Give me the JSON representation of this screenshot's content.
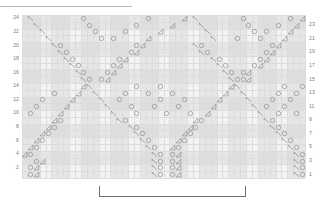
{
  "chart_meta": {
    "title": "",
    "type": "knitting-lace-chart",
    "columns": 48,
    "rows": 24,
    "grid_left_px": 22,
    "grid_top_px": 15,
    "grid_width_px": 283,
    "grid_height_px": 163,
    "cell_w_px": 5.896,
    "cell_h_px": 6.792,
    "colors": {
      "grid_background": "#f3f3f3",
      "grid_line": "#dcdcdc",
      "shaded_band": "#e6e6e6",
      "symbol_stroke": "#8c8c8c",
      "row_label": "#7d7d7d",
      "bracket": "#6f6f6f",
      "top_rule": "#b9b9b9"
    }
  },
  "row_labels_left": [
    "24",
    "22",
    "20",
    "18",
    "16",
    "14",
    "12",
    "10",
    "8",
    "6",
    "4",
    "2"
  ],
  "row_labels_right": [
    "23",
    "21",
    "19",
    "17",
    "15",
    "13",
    "11",
    "9",
    "7",
    "5",
    "3",
    "1"
  ],
  "legend": {
    "yarn_over": "O",
    "ssk_left_leaning_decrease": "left-triangle",
    "k2tog_right_leaning_decrease": "right-triangle"
  },
  "repeat_bracket": {
    "label": "",
    "start_col": 13,
    "end_col": 37
  },
  "shaded_column_bands": [
    {
      "start_col": 0,
      "end_col": 2
    },
    {
      "start_col": 5,
      "end_col": 7
    },
    {
      "start_col": 10,
      "end_col": 12
    },
    {
      "start_col": 15,
      "end_col": 17
    },
    {
      "start_col": 20,
      "end_col": 22
    },
    {
      "start_col": 25,
      "end_col": 27
    },
    {
      "start_col": 30,
      "end_col": 32
    },
    {
      "start_col": 35,
      "end_col": 37
    },
    {
      "start_col": 40,
      "end_col": 42
    },
    {
      "start_col": 45,
      "end_col": 47
    }
  ],
  "chart_data": {
    "type": "heatmap",
    "xlabel": "stitch",
    "ylabel": "row",
    "symbols": [
      {
        "row": 24,
        "col": 1,
        "s": "ssk"
      },
      {
        "row": 24,
        "col": 10,
        "s": "yo"
      },
      {
        "row": 24,
        "col": 21,
        "s": "yo"
      },
      {
        "row": 24,
        "col": 27,
        "s": "k2tog"
      },
      {
        "row": 24,
        "col": 29,
        "s": "ssk"
      },
      {
        "row": 24,
        "col": 37,
        "s": "yo"
      },
      {
        "row": 24,
        "col": 45,
        "s": "yo"
      },
      {
        "row": 24,
        "col": 47,
        "s": "k2tog"
      },
      {
        "row": 23,
        "col": 2,
        "s": "ssk"
      },
      {
        "row": 23,
        "col": 11,
        "s": "yo"
      },
      {
        "row": 23,
        "col": 19,
        "s": "yo"
      },
      {
        "row": 23,
        "col": 25,
        "s": "k2tog"
      },
      {
        "row": 23,
        "col": 30,
        "s": "ssk"
      },
      {
        "row": 23,
        "col": 38,
        "s": "yo"
      },
      {
        "row": 23,
        "col": 43,
        "s": "yo"
      },
      {
        "row": 23,
        "col": 46,
        "s": "k2tog"
      },
      {
        "row": 22,
        "col": 3,
        "s": "ssk"
      },
      {
        "row": 22,
        "col": 12,
        "s": "yo"
      },
      {
        "row": 22,
        "col": 17,
        "s": "yo"
      },
      {
        "row": 22,
        "col": 23,
        "s": "k2tog"
      },
      {
        "row": 22,
        "col": 31,
        "s": "ssk"
      },
      {
        "row": 22,
        "col": 39,
        "s": "yo"
      },
      {
        "row": 22,
        "col": 41,
        "s": "yo"
      },
      {
        "row": 22,
        "col": 45,
        "s": "k2tog"
      },
      {
        "row": 21,
        "col": 4,
        "s": "ssk"
      },
      {
        "row": 21,
        "col": 13,
        "s": "yo"
      },
      {
        "row": 21,
        "col": 15,
        "s": "yo"
      },
      {
        "row": 21,
        "col": 21,
        "s": "k2tog"
      },
      {
        "row": 21,
        "col": 32,
        "s": "ssk"
      },
      {
        "row": 21,
        "col": 36,
        "s": "yo"
      },
      {
        "row": 21,
        "col": 40,
        "s": "yo"
      },
      {
        "row": 21,
        "col": 44,
        "s": "k2tog"
      },
      {
        "row": 20,
        "col": 5,
        "s": "ssk"
      },
      {
        "row": 20,
        "col": 6,
        "s": "yo"
      },
      {
        "row": 20,
        "col": 19,
        "s": "yo"
      },
      {
        "row": 20,
        "col": 20,
        "s": "k2tog"
      },
      {
        "row": 20,
        "col": 29,
        "s": "ssk"
      },
      {
        "row": 20,
        "col": 30,
        "s": "yo"
      },
      {
        "row": 20,
        "col": 42,
        "s": "yo"
      },
      {
        "row": 20,
        "col": 43,
        "s": "k2tog"
      },
      {
        "row": 19,
        "col": 6,
        "s": "ssk"
      },
      {
        "row": 19,
        "col": 7,
        "s": "yo"
      },
      {
        "row": 19,
        "col": 18,
        "s": "yo"
      },
      {
        "row": 19,
        "col": 19,
        "s": "k2tog"
      },
      {
        "row": 19,
        "col": 30,
        "s": "ssk"
      },
      {
        "row": 19,
        "col": 31,
        "s": "yo"
      },
      {
        "row": 19,
        "col": 41,
        "s": "yo"
      },
      {
        "row": 19,
        "col": 42,
        "s": "k2tog"
      },
      {
        "row": 18,
        "col": 7,
        "s": "ssk"
      },
      {
        "row": 18,
        "col": 8,
        "s": "yo"
      },
      {
        "row": 18,
        "col": 16,
        "s": "yo"
      },
      {
        "row": 18,
        "col": 17,
        "s": "k2tog"
      },
      {
        "row": 18,
        "col": 32,
        "s": "ssk"
      },
      {
        "row": 18,
        "col": 33,
        "s": "yo"
      },
      {
        "row": 18,
        "col": 40,
        "s": "yo"
      },
      {
        "row": 18,
        "col": 41,
        "s": "k2tog"
      },
      {
        "row": 17,
        "col": 8,
        "s": "ssk"
      },
      {
        "row": 17,
        "col": 9,
        "s": "yo"
      },
      {
        "row": 17,
        "col": 15,
        "s": "yo"
      },
      {
        "row": 17,
        "col": 16,
        "s": "k2tog"
      },
      {
        "row": 17,
        "col": 33,
        "s": "ssk"
      },
      {
        "row": 17,
        "col": 34,
        "s": "yo"
      },
      {
        "row": 17,
        "col": 39,
        "s": "yo"
      },
      {
        "row": 17,
        "col": 40,
        "s": "k2tog"
      },
      {
        "row": 16,
        "col": 9,
        "s": "ssk"
      },
      {
        "row": 16,
        "col": 10,
        "s": "yo"
      },
      {
        "row": 16,
        "col": 14,
        "s": "yo"
      },
      {
        "row": 16,
        "col": 15,
        "s": "k2tog"
      },
      {
        "row": 16,
        "col": 34,
        "s": "ssk"
      },
      {
        "row": 16,
        "col": 35,
        "s": "yo"
      },
      {
        "row": 16,
        "col": 37,
        "s": "yo"
      },
      {
        "row": 16,
        "col": 38,
        "s": "k2tog"
      },
      {
        "row": 15,
        "col": 10,
        "s": "ssk"
      },
      {
        "row": 15,
        "col": 11,
        "s": "yo"
      },
      {
        "row": 15,
        "col": 13,
        "s": "yo"
      },
      {
        "row": 15,
        "col": 14,
        "s": "k2tog"
      },
      {
        "row": 15,
        "col": 35,
        "s": "ssk"
      },
      {
        "row": 15,
        "col": 36,
        "s": "yo"
      },
      {
        "row": 15,
        "col": 37,
        "s": "yo"
      },
      {
        "row": 15,
        "col": 38,
        "s": "k2tog"
      },
      {
        "row": 14,
        "col": 10,
        "s": "k2tog"
      },
      {
        "row": 14,
        "col": 11,
        "s": "ssk"
      },
      {
        "row": 14,
        "col": 19,
        "s": "yo"
      },
      {
        "row": 14,
        "col": 23,
        "s": "yo"
      },
      {
        "row": 14,
        "col": 35,
        "s": "k2tog"
      },
      {
        "row": 14,
        "col": 36,
        "s": "ssk"
      },
      {
        "row": 14,
        "col": 44,
        "s": "yo"
      },
      {
        "row": 14,
        "col": 47,
        "s": "yo"
      },
      {
        "row": 13,
        "col": 5,
        "s": "yo"
      },
      {
        "row": 13,
        "col": 9,
        "s": "k2tog"
      },
      {
        "row": 13,
        "col": 12,
        "s": "ssk"
      },
      {
        "row": 13,
        "col": 17,
        "s": "yo"
      },
      {
        "row": 13,
        "col": 21,
        "s": "yo"
      },
      {
        "row": 13,
        "col": 25,
        "s": "yo"
      },
      {
        "row": 13,
        "col": 34,
        "s": "k2tog"
      },
      {
        "row": 13,
        "col": 37,
        "s": "ssk"
      },
      {
        "row": 13,
        "col": 43,
        "s": "yo"
      },
      {
        "row": 13,
        "col": 46,
        "s": "yo"
      },
      {
        "row": 12,
        "col": 3,
        "s": "yo"
      },
      {
        "row": 12,
        "col": 8,
        "s": "k2tog"
      },
      {
        "row": 12,
        "col": 13,
        "s": "ssk"
      },
      {
        "row": 12,
        "col": 16,
        "s": "yo"
      },
      {
        "row": 12,
        "col": 23,
        "s": "yo"
      },
      {
        "row": 12,
        "col": 27,
        "s": "yo"
      },
      {
        "row": 12,
        "col": 33,
        "s": "k2tog"
      },
      {
        "row": 12,
        "col": 38,
        "s": "ssk"
      },
      {
        "row": 12,
        "col": 42,
        "s": "yo"
      },
      {
        "row": 12,
        "col": 45,
        "s": "yo"
      },
      {
        "row": 11,
        "col": 2,
        "s": "yo"
      },
      {
        "row": 11,
        "col": 7,
        "s": "k2tog"
      },
      {
        "row": 11,
        "col": 14,
        "s": "ssk"
      },
      {
        "row": 11,
        "col": 18,
        "s": "yo"
      },
      {
        "row": 11,
        "col": 22,
        "s": "yo"
      },
      {
        "row": 11,
        "col": 26,
        "s": "yo"
      },
      {
        "row": 11,
        "col": 32,
        "s": "k2tog"
      },
      {
        "row": 11,
        "col": 39,
        "s": "ssk"
      },
      {
        "row": 11,
        "col": 41,
        "s": "yo"
      },
      {
        "row": 11,
        "col": 44,
        "s": "yo"
      },
      {
        "row": 10,
        "col": 1,
        "s": "yo"
      },
      {
        "row": 10,
        "col": 6,
        "s": "k2tog"
      },
      {
        "row": 10,
        "col": 15,
        "s": "ssk"
      },
      {
        "row": 10,
        "col": 19,
        "s": "yo"
      },
      {
        "row": 10,
        "col": 24,
        "s": "yo"
      },
      {
        "row": 10,
        "col": 28,
        "s": "yo"
      },
      {
        "row": 10,
        "col": 31,
        "s": "k2tog"
      },
      {
        "row": 10,
        "col": 40,
        "s": "ssk"
      },
      {
        "row": 10,
        "col": 43,
        "s": "yo"
      },
      {
        "row": 10,
        "col": 46,
        "s": "yo"
      },
      {
        "row": 9,
        "col": 5,
        "s": "k2tog"
      },
      {
        "row": 9,
        "col": 6,
        "s": "yo"
      },
      {
        "row": 9,
        "col": 16,
        "s": "ssk"
      },
      {
        "row": 9,
        "col": 17,
        "s": "yo"
      },
      {
        "row": 9,
        "col": 29,
        "s": "k2tog"
      },
      {
        "row": 9,
        "col": 30,
        "s": "yo"
      },
      {
        "row": 9,
        "col": 41,
        "s": "ssk"
      },
      {
        "row": 9,
        "col": 42,
        "s": "yo"
      },
      {
        "row": 8,
        "col": 4,
        "s": "k2tog"
      },
      {
        "row": 8,
        "col": 5,
        "s": "yo"
      },
      {
        "row": 8,
        "col": 18,
        "s": "ssk"
      },
      {
        "row": 8,
        "col": 19,
        "s": "yo"
      },
      {
        "row": 8,
        "col": 28,
        "s": "k2tog"
      },
      {
        "row": 8,
        "col": 29,
        "s": "yo"
      },
      {
        "row": 8,
        "col": 42,
        "s": "ssk"
      },
      {
        "row": 8,
        "col": 43,
        "s": "yo"
      },
      {
        "row": 7,
        "col": 3,
        "s": "k2tog"
      },
      {
        "row": 7,
        "col": 4,
        "s": "yo"
      },
      {
        "row": 7,
        "col": 19,
        "s": "ssk"
      },
      {
        "row": 7,
        "col": 20,
        "s": "yo"
      },
      {
        "row": 7,
        "col": 27,
        "s": "k2tog"
      },
      {
        "row": 7,
        "col": 28,
        "s": "yo"
      },
      {
        "row": 7,
        "col": 43,
        "s": "ssk"
      },
      {
        "row": 7,
        "col": 44,
        "s": "yo"
      },
      {
        "row": 6,
        "col": 2,
        "s": "k2tog"
      },
      {
        "row": 6,
        "col": 3,
        "s": "yo"
      },
      {
        "row": 6,
        "col": 20,
        "s": "ssk"
      },
      {
        "row": 6,
        "col": 21,
        "s": "yo"
      },
      {
        "row": 6,
        "col": 26,
        "s": "k2tog"
      },
      {
        "row": 6,
        "col": 27,
        "s": "yo"
      },
      {
        "row": 6,
        "col": 44,
        "s": "ssk"
      },
      {
        "row": 6,
        "col": 45,
        "s": "yo"
      },
      {
        "row": 5,
        "col": 1,
        "s": "k2tog"
      },
      {
        "row": 5,
        "col": 2,
        "s": "yo"
      },
      {
        "row": 5,
        "col": 21,
        "s": "ssk"
      },
      {
        "row": 5,
        "col": 22,
        "s": "yo"
      },
      {
        "row": 5,
        "col": 25,
        "s": "k2tog"
      },
      {
        "row": 5,
        "col": 26,
        "s": "yo"
      },
      {
        "row": 5,
        "col": 45,
        "s": "ssk"
      },
      {
        "row": 5,
        "col": 46,
        "s": "yo"
      },
      {
        "row": 4,
        "col": 0,
        "s": "k2tog"
      },
      {
        "row": 4,
        "col": 1,
        "s": "yo"
      },
      {
        "row": 4,
        "col": 22,
        "s": "ssk"
      },
      {
        "row": 4,
        "col": 23,
        "s": "yo"
      },
      {
        "row": 4,
        "col": 25,
        "s": "yo"
      },
      {
        "row": 4,
        "col": 26,
        "s": "k2tog"
      },
      {
        "row": 4,
        "col": 46,
        "s": "ssk"
      },
      {
        "row": 4,
        "col": 47,
        "s": "yo"
      },
      {
        "row": 3,
        "col": 2,
        "s": "yo"
      },
      {
        "row": 3,
        "col": 3,
        "s": "k2tog"
      },
      {
        "row": 3,
        "col": 22,
        "s": "ssk"
      },
      {
        "row": 3,
        "col": 23,
        "s": "yo"
      },
      {
        "row": 3,
        "col": 25,
        "s": "yo"
      },
      {
        "row": 3,
        "col": 26,
        "s": "k2tog"
      },
      {
        "row": 3,
        "col": 46,
        "s": "ssk"
      },
      {
        "row": 3,
        "col": 47,
        "s": "yo"
      },
      {
        "row": 2,
        "col": 1,
        "s": "yo"
      },
      {
        "row": 2,
        "col": 2,
        "s": "k2tog"
      },
      {
        "row": 2,
        "col": 22,
        "s": "ssk"
      },
      {
        "row": 2,
        "col": 23,
        "s": "yo"
      },
      {
        "row": 2,
        "col": 25,
        "s": "yo"
      },
      {
        "row": 2,
        "col": 26,
        "s": "k2tog"
      },
      {
        "row": 2,
        "col": 46,
        "s": "ssk"
      },
      {
        "row": 2,
        "col": 47,
        "s": "yo"
      },
      {
        "row": 1,
        "col": 1,
        "s": "yo"
      },
      {
        "row": 1,
        "col": 2,
        "s": "k2tog"
      },
      {
        "row": 1,
        "col": 22,
        "s": "ssk"
      },
      {
        "row": 1,
        "col": 23,
        "s": "yo"
      },
      {
        "row": 1,
        "col": 25,
        "s": "yo"
      },
      {
        "row": 1,
        "col": 26,
        "s": "k2tog"
      },
      {
        "row": 1,
        "col": 46,
        "s": "ssk"
      },
      {
        "row": 1,
        "col": 47,
        "s": "yo"
      }
    ]
  }
}
